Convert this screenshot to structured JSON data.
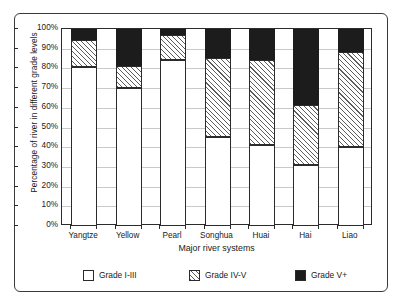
{
  "chart_data": {
    "type": "bar",
    "subtype": "stacked-bar-100-percent",
    "title": "",
    "xlabel": "Major river systems",
    "ylabel": "Percentage of river in different grade levels",
    "categories": [
      "Yangtze",
      "Yellow",
      "Pearl",
      "Songhua",
      "Huai",
      "Hai",
      "Liao"
    ],
    "series": [
      {
        "name": "Grade I-III",
        "swatch": "white",
        "color": "#ffffff",
        "values": [
          80.8,
          70.0,
          84.5,
          45.0,
          41.2,
          31.0,
          40.0
        ]
      },
      {
        "name": "Grade IV-V",
        "swatch": "hatched",
        "color": "#ffffff",
        "values": [
          13.6,
          11.0,
          12.5,
          40.3,
          43.3,
          30.5,
          48.5
        ]
      },
      {
        "name": "Grade V+",
        "swatch": "black",
        "color": "#1c1c1c",
        "values": [
          5.6,
          19.0,
          3.0,
          14.7,
          15.5,
          38.5,
          11.5
        ]
      }
    ],
    "cumulative_tops": {
      "grade_i_iii": [
        80.8,
        70.0,
        84.5,
        45.0,
        41.2,
        31.0,
        40.0
      ],
      "grade_iv_v": [
        94.4,
        81.0,
        97.0,
        85.3,
        84.5,
        61.5,
        88.5
      ],
      "grade_v_plus": [
        100,
        100,
        100,
        100,
        100,
        100,
        100
      ]
    },
    "ylim": [
      0,
      100
    ],
    "ytick_labels": [
      "0%",
      "10%",
      "20%",
      "30%",
      "40%",
      "50%",
      "60%",
      "70%",
      "80%",
      "90%",
      "100%"
    ],
    "ytick_values": [
      0,
      10,
      20,
      30,
      40,
      50,
      60,
      70,
      80,
      90,
      100
    ],
    "grid": "horizontal",
    "legend_position": "bottom",
    "legend_entries": [
      "Grade I-III",
      "Grade IV-V",
      "Grade V+"
    ]
  }
}
